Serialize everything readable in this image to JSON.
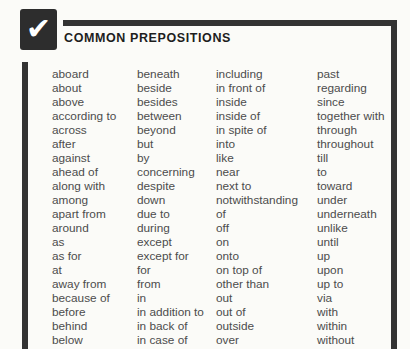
{
  "header": {
    "title": "COMMON PREPOSITIONS",
    "checkmark_glyph": "✔"
  },
  "colors": {
    "background": "#fbfbf8",
    "frame": "#333333",
    "checkbox_bg": "#2d2d2d",
    "checkmark": "#ffffff",
    "title_text": "#1e1e1e",
    "body_text": "#4c4c4c"
  },
  "prepositions": {
    "columns": [
      [
        "aboard",
        "about",
        "above",
        "according to",
        "across",
        "after",
        "against",
        "ahead of",
        "along with",
        "among",
        "apart from",
        "around",
        "as",
        "as for",
        "at",
        "away from",
        "because of",
        "before",
        "behind",
        "below"
      ],
      [
        "beneath",
        "beside",
        "besides",
        "between",
        "beyond",
        "but",
        "by",
        "concerning",
        "despite",
        "down",
        "due to",
        "during",
        "except",
        "except for",
        "for",
        "from",
        "in",
        "in addition to",
        "in back of",
        "in case of"
      ],
      [
        "including",
        "in front of",
        "inside",
        "inside of",
        "in spite of",
        "into",
        "like",
        "near",
        "next to",
        "notwithstanding",
        "of",
        "off",
        "on",
        "onto",
        "on top of",
        "other than",
        "out",
        "out of",
        "outside",
        "over"
      ],
      [
        "past",
        "regarding",
        "since",
        "together with",
        "through",
        "throughout",
        "till",
        "to",
        "toward",
        "under",
        "underneath",
        "unlike",
        "until",
        "up",
        "upon",
        "up to",
        "via",
        "with",
        "within",
        "without"
      ]
    ]
  }
}
